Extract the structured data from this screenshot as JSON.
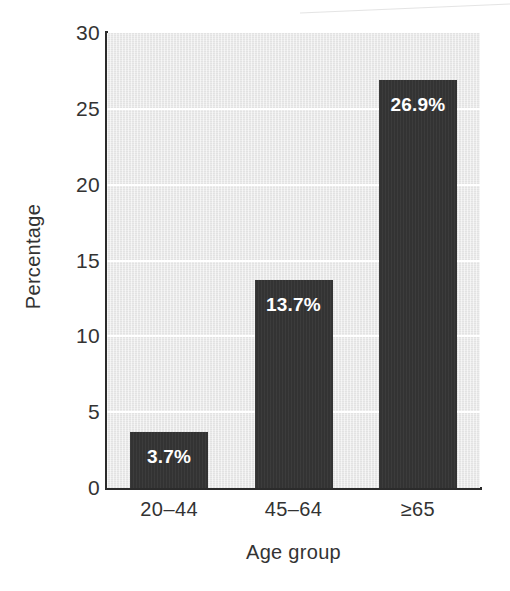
{
  "chart_data": {
    "type": "bar",
    "title": "",
    "subtitle": "",
    "xlabel": "Age group",
    "ylabel": "Percentage",
    "categories": [
      "20–44",
      "45–64",
      "≥65"
    ],
    "values": [
      3.7,
      13.7,
      26.9
    ],
    "data_labels": [
      "3.7%",
      "13.7%",
      "26.9%"
    ],
    "ylim": [
      0,
      30
    ],
    "yticks": [
      0,
      5,
      10,
      15,
      20,
      25,
      30
    ],
    "ytick_labels": [
      "0",
      "5",
      "10",
      "15",
      "20",
      "25",
      "30"
    ],
    "grid": true,
    "grid_orientation": "horizontal",
    "legend": "none",
    "series": [
      {
        "name": "Percentage",
        "values": [
          3.7,
          13.7,
          26.9
        ]
      }
    ]
  },
  "colors": {
    "bar_fill": "#333333",
    "plot_background": "#eaeaea",
    "gridline": "#ffffff",
    "axis_line": "#2b2b2b",
    "text": "#333333",
    "data_label_text": "#ffffff",
    "page_background": "#ffffff"
  }
}
